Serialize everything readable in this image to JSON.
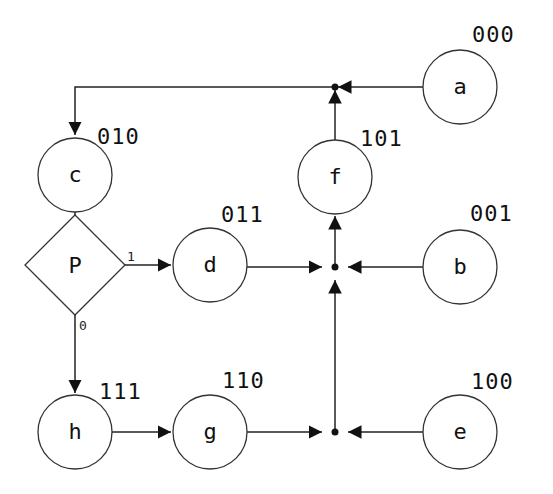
{
  "diagram": {
    "type": "state-flow",
    "nodes": [
      {
        "id": "a",
        "label": "a",
        "code": "000",
        "shape": "circle"
      },
      {
        "id": "b",
        "label": "b",
        "code": "001",
        "shape": "circle"
      },
      {
        "id": "c",
        "label": "c",
        "code": "010",
        "shape": "circle"
      },
      {
        "id": "d",
        "label": "d",
        "code": "011",
        "shape": "circle"
      },
      {
        "id": "e",
        "label": "e",
        "code": "100",
        "shape": "circle"
      },
      {
        "id": "f",
        "label": "f",
        "code": "101",
        "shape": "circle"
      },
      {
        "id": "g",
        "label": "g",
        "code": "110",
        "shape": "circle"
      },
      {
        "id": "h",
        "label": "h",
        "code": "111",
        "shape": "circle"
      },
      {
        "id": "P",
        "label": "P",
        "shape": "diamond"
      }
    ],
    "branches": {
      "true_label": "1",
      "false_label": "0"
    },
    "edges": [
      {
        "from": "a",
        "to": "c",
        "via": "junction-top"
      },
      {
        "from": "f",
        "to": "c",
        "via": "junction-top"
      },
      {
        "from": "c",
        "to": "P"
      },
      {
        "from": "P",
        "to": "d",
        "label": "1"
      },
      {
        "from": "P",
        "to": "h",
        "label": "0"
      },
      {
        "from": "h",
        "to": "g"
      },
      {
        "from": "d",
        "to": "f",
        "via": "junction-mid"
      },
      {
        "from": "b",
        "to": "f",
        "via": "junction-mid"
      },
      {
        "from": "g",
        "to": "f",
        "via": "junction-bottom"
      },
      {
        "from": "e",
        "to": "f",
        "via": "junction-bottom"
      }
    ]
  }
}
